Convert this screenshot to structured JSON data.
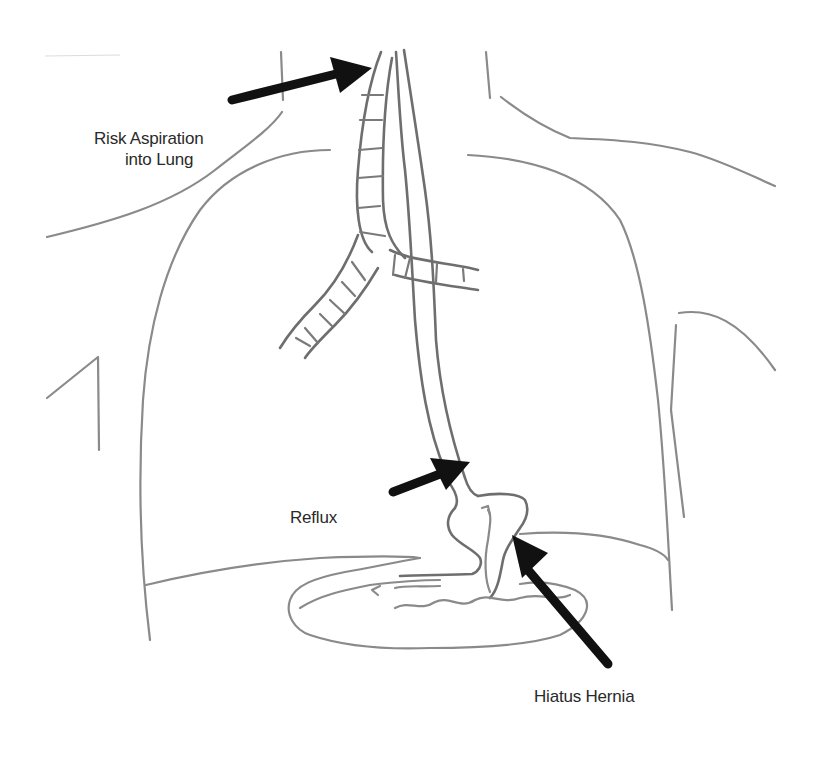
{
  "diagram": {
    "type": "anatomical-illustration",
    "labels": {
      "aspiration_line1": "Risk Aspiration",
      "aspiration_line2": "into Lung",
      "reflux": "Reflux",
      "hiatus_hernia": "Hiatus Hernia"
    },
    "structures": [
      "trachea",
      "bronchi",
      "oesophagus",
      "lungs",
      "diaphragm",
      "stomach",
      "herniated-stomach-portion",
      "shoulders",
      "arms"
    ],
    "arrows": [
      {
        "name": "aspiration-arrow",
        "points_to": "upper-airway"
      },
      {
        "name": "reflux-arrow",
        "points_to": "gastro-oesophageal-junction"
      },
      {
        "name": "hiatus-hernia-arrow",
        "points_to": "herniated-stomach"
      }
    ],
    "colors": {
      "background": "#ffffff",
      "outline": "#8a8a8a",
      "arrow": "#111111",
      "text": "#2a2a2a"
    }
  }
}
